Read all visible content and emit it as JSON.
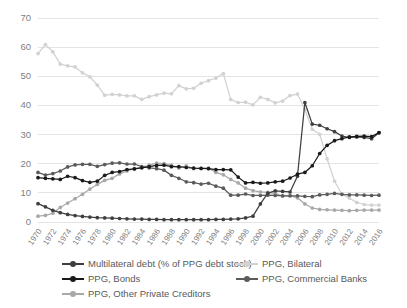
{
  "chart_data": {
    "type": "line",
    "title": "",
    "subtitle": "",
    "xlabel": "",
    "ylabel": "",
    "ylim": [
      0,
      70
    ],
    "ytick_step": 10,
    "yticks": [
      0,
      10,
      20,
      30,
      40,
      50,
      60,
      70
    ],
    "grid": true,
    "legend_position": "bottom",
    "x_tick_step": 2,
    "x": [
      1970,
      1971,
      1972,
      1973,
      1974,
      1975,
      1976,
      1977,
      1978,
      1979,
      1980,
      1981,
      1982,
      1983,
      1984,
      1985,
      1986,
      1987,
      1988,
      1989,
      1990,
      1991,
      1992,
      1993,
      1994,
      1995,
      1996,
      1997,
      1998,
      1999,
      2000,
      2001,
      2002,
      2003,
      2004,
      2005,
      2006,
      2007,
      2008,
      2009,
      2010,
      2011,
      2012,
      2013,
      2014,
      2015,
      2016
    ],
    "xticklabels": [
      "1970",
      "1972",
      "1974",
      "1976",
      "1978",
      "1980",
      "1982",
      "1984",
      "1986",
      "1988",
      "1990",
      "1992",
      "1994",
      "1996",
      "1998",
      "2000",
      "2002",
      "2004",
      "2006",
      "2008",
      "2010",
      "2012",
      "2014",
      "2016"
    ],
    "series": [
      {
        "name": "Multilateral debt (% of PPG debt stock)",
        "color": "#3F3F3F",
        "values": [
          6.3,
          5.2,
          4.0,
          3.2,
          2.6,
          2.2,
          1.9,
          1.7,
          1.5,
          1.4,
          1.3,
          1.2,
          1.1,
          1.0,
          1.0,
          0.9,
          0.9,
          0.8,
          0.8,
          0.8,
          0.8,
          0.8,
          0.8,
          0.8,
          0.9,
          0.9,
          1.0,
          1.1,
          1.4,
          2.0,
          6.2,
          9.9,
          10.7,
          10.5,
          10.3,
          15.7,
          41.0,
          33.6,
          33.2,
          32.0,
          31.0,
          29.5,
          29.0,
          29.2,
          29.0,
          28.6,
          30.6
        ]
      },
      {
        "name": "PPG, Bilateral",
        "color": "#D2D2D2",
        "values": [
          57.8,
          60.9,
          58.4,
          54.2,
          53.6,
          53.2,
          51.2,
          49.8,
          47.0,
          43.5,
          43.8,
          43.6,
          43.3,
          43.3,
          42.1,
          43.0,
          43.6,
          44.2,
          44.0,
          46.8,
          45.7,
          45.9,
          47.6,
          48.5,
          49.4,
          50.9,
          42.0,
          41.0,
          41.1,
          40.2,
          42.8,
          42.1,
          40.9,
          41.5,
          43.4,
          43.9,
          38.6,
          31.8,
          30.1,
          21.7,
          14.0,
          9.5,
          8.2,
          6.7,
          6.0,
          5.8,
          5.8
        ]
      },
      {
        "name": "PPG, Bonds",
        "color": "#1A1A1A",
        "values": [
          15.2,
          15.0,
          14.8,
          14.6,
          15.7,
          15.2,
          14.2,
          13.6,
          14.0,
          16.0,
          17.0,
          17.3,
          18.0,
          18.2,
          18.6,
          19.0,
          19.4,
          19.5,
          19.0,
          19.0,
          18.7,
          18.5,
          18.4,
          18.3,
          18.0,
          18.0,
          17.9,
          15.4,
          13.4,
          13.6,
          13.3,
          13.4,
          13.8,
          14.0,
          15.1,
          16.4,
          17.0,
          19.3,
          23.5,
          26.3,
          27.9,
          28.6,
          29.2,
          29.4,
          29.5,
          29.3,
          30.7
        ]
      },
      {
        "name": "PPG, Commercial Banks",
        "color": "#5B5B5B",
        "values": [
          17.0,
          16.1,
          16.6,
          17.5,
          18.9,
          19.6,
          19.8,
          19.8,
          19.1,
          19.7,
          20.2,
          20.3,
          19.9,
          19.9,
          19.0,
          18.6,
          18.3,
          17.8,
          16.0,
          15.0,
          13.8,
          13.5,
          13.0,
          13.3,
          12.3,
          11.6,
          9.2,
          9.2,
          9.6,
          9.1,
          9.1,
          9.2,
          9.1,
          9.0,
          9.0,
          9.0,
          8.8,
          8.7,
          9.3,
          9.5,
          9.8,
          9.5,
          9.3,
          9.3,
          9.2,
          9.1,
          9.2
        ]
      },
      {
        "name": "PPG, Other Private Creditors",
        "color": "#A8A8A8",
        "values": [
          2.0,
          2.3,
          3.0,
          5.0,
          6.5,
          8.0,
          9.5,
          11.3,
          12.9,
          14.3,
          15.0,
          16.5,
          17.5,
          18.3,
          18.8,
          19.5,
          20.2,
          20.0,
          19.5,
          18.5,
          19.3,
          18.3,
          18.4,
          18.5,
          17.0,
          16.2,
          14.6,
          13.4,
          11.6,
          10.8,
          10.3,
          10.2,
          9.8,
          8.9,
          9.0,
          8.3,
          6.2,
          4.8,
          4.3,
          4.2,
          4.1,
          4.0,
          3.9,
          4.0,
          4.1,
          4.1,
          4.1
        ]
      }
    ]
  },
  "legend": {
    "items": [
      {
        "label": "Multilateral debt (% of PPG debt stock)",
        "color": "#3F3F3F",
        "row": 0,
        "col": 0
      },
      {
        "label": "PPG, Bilateral",
        "color": "#D2D2D2",
        "row": 0,
        "col": 1
      },
      {
        "label": "PPG, Bonds",
        "color": "#1A1A1A",
        "row": 1,
        "col": 0
      },
      {
        "label": "PPG, Commercial Banks",
        "color": "#5B5B5B",
        "row": 1,
        "col": 1
      },
      {
        "label": "PPG, Other Private Creditors",
        "color": "#A8A8A8",
        "row": 2,
        "col": 0
      }
    ]
  },
  "style": {
    "grid_color": "#D9D9D9",
    "tick_label_color": "#7F7F7F",
    "legend_text_color": "#595959",
    "background": "#FFFFFF"
  }
}
